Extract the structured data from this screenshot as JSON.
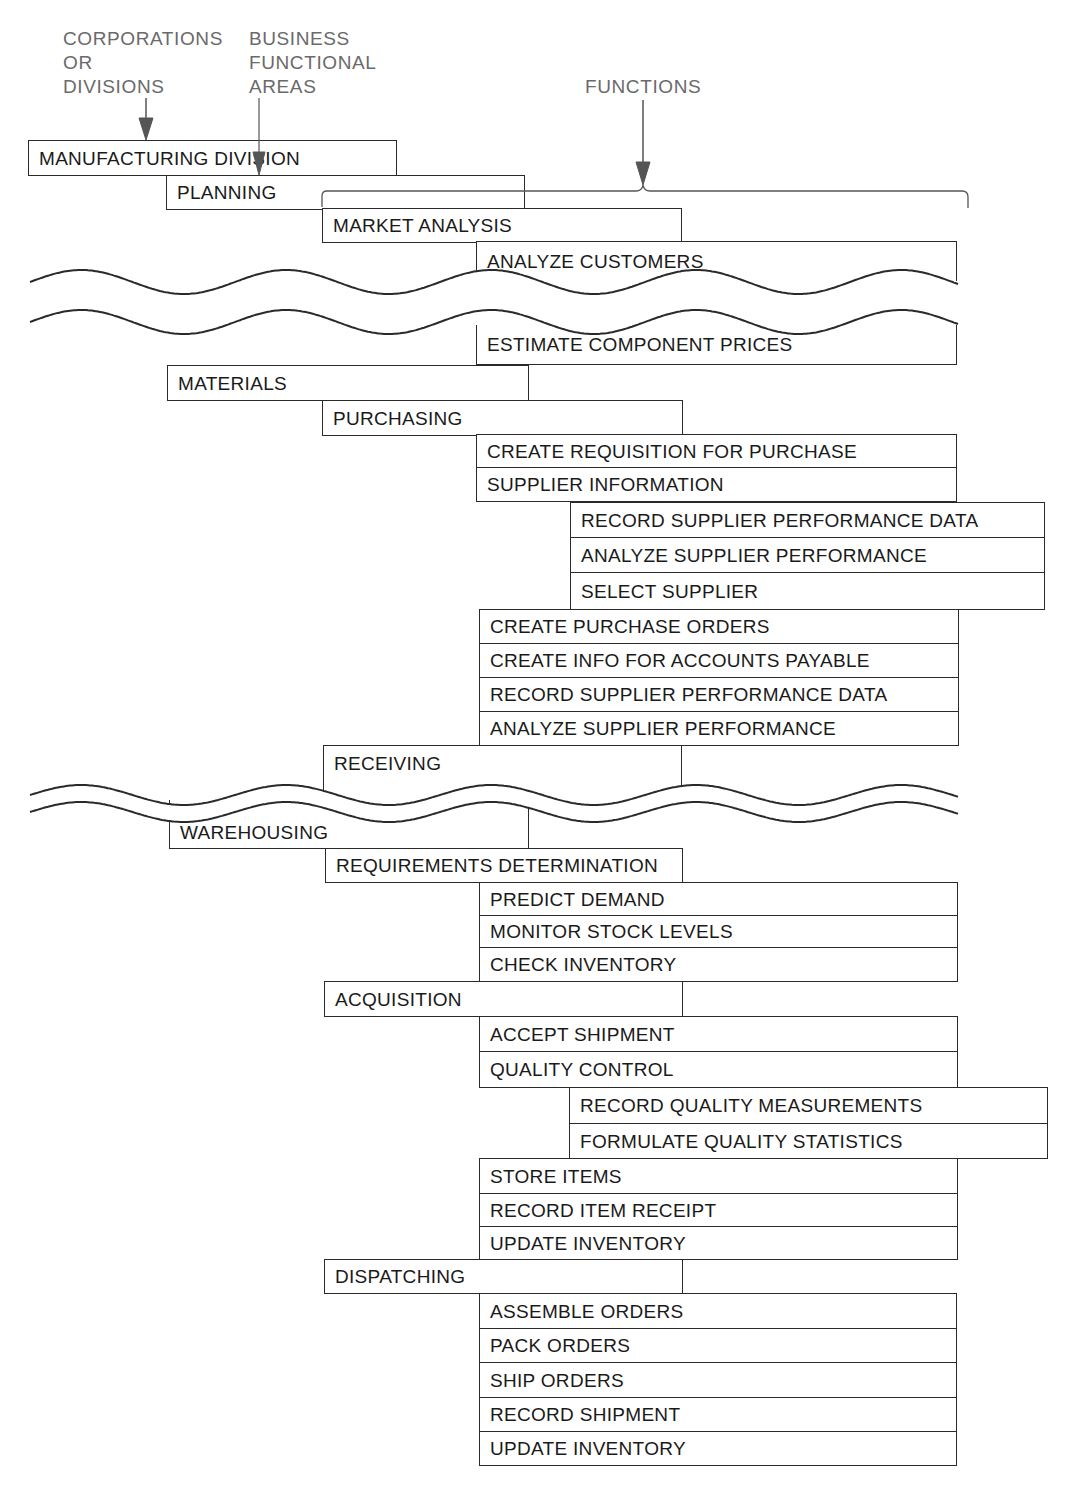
{
  "headers": [
    {
      "id": "corp",
      "lines": "CORPORATIONS\nOR\nDIVISIONS",
      "x": 63,
      "y": 27
    },
    {
      "id": "bfa",
      "lines": "BUSINESS\nFUNCTIONAL\nAREAS",
      "x": 249,
      "y": 27
    },
    {
      "id": "func",
      "lines": "FUNCTIONS",
      "x": 585,
      "y": 75
    }
  ],
  "colors": {
    "line": "#2a2a2a",
    "header_text": "#6a6a6a",
    "arrow": "#555555"
  },
  "boxes": [
    {
      "label": "MANUFACTURING DIVISION",
      "level": "division",
      "x": 28,
      "y": 140,
      "w": 369,
      "h": 36
    },
    {
      "label": "PLANNING",
      "level": "area",
      "x": 166,
      "y": 175,
      "w": 359,
      "h": 35
    },
    {
      "label": "MARKET ANALYSIS",
      "level": "sub-area",
      "x": 322,
      "y": 208,
      "w": 360,
      "h": 35
    },
    {
      "label": "ANALYZE CUSTOMERS",
      "level": "function",
      "x": 476,
      "y": 241,
      "w": 481,
      "h": 40,
      "wavy_bottom": true
    },
    {
      "label": "ESTIMATE COMPONENT PRICES",
      "level": "function",
      "x": 476,
      "y": 325,
      "w": 481,
      "h": 40,
      "wavy_top": true
    },
    {
      "label": "MATERIALS",
      "level": "area",
      "x": 167,
      "y": 365,
      "w": 362,
      "h": 36
    },
    {
      "label": "PURCHASING",
      "level": "sub-area",
      "x": 322,
      "y": 400,
      "w": 361,
      "h": 36
    },
    {
      "label": "CREATE REQUISITION FOR PURCHASE",
      "level": "function",
      "x": 476,
      "y": 434,
      "w": 481,
      "h": 35
    },
    {
      "label": "SUPPLIER INFORMATION",
      "level": "function",
      "x": 476,
      "y": 467,
      "w": 481,
      "h": 35
    },
    {
      "label": "RECORD SUPPLIER PERFORMANCE DATA",
      "level": "sub-function",
      "x": 570,
      "y": 502,
      "w": 475,
      "h": 36
    },
    {
      "label": "ANALYZE SUPPLIER PERFORMANCE",
      "level": "sub-function",
      "x": 570,
      "y": 537,
      "w": 475,
      "h": 36
    },
    {
      "label": "SELECT SUPPLIER",
      "level": "sub-function",
      "x": 570,
      "y": 572,
      "w": 475,
      "h": 38
    },
    {
      "label": "CREATE PURCHASE ORDERS",
      "level": "function",
      "x": 479,
      "y": 609,
      "w": 480,
      "h": 35
    },
    {
      "label": "CREATE INFO FOR ACCOUNTS PAYABLE",
      "level": "function",
      "x": 479,
      "y": 643,
      "w": 480,
      "h": 35
    },
    {
      "label": "RECORD SUPPLIER PERFORMANCE DATA",
      "level": "function",
      "x": 479,
      "y": 677,
      "w": 480,
      "h": 35
    },
    {
      "label": "ANALYZE SUPPLIER PERFORMANCE",
      "level": "function",
      "x": 479,
      "y": 711,
      "w": 480,
      "h": 35
    },
    {
      "label": "RECEIVING",
      "level": "sub-area",
      "x": 323,
      "y": 745,
      "w": 359,
      "h": 58,
      "wavy_bottom": true,
      "align_top": true
    },
    {
      "label": "WAREHOUSING",
      "level": "area",
      "x": 169,
      "y": 800,
      "w": 360,
      "h": 49,
      "wavy_top": true,
      "align_bottom": true
    },
    {
      "label": "REQUIREMENTS DETERMINATION",
      "level": "sub-area",
      "x": 325,
      "y": 848,
      "w": 358,
      "h": 35
    },
    {
      "label": "PREDICT DEMAND",
      "level": "function",
      "x": 479,
      "y": 882,
      "w": 479,
      "h": 34
    },
    {
      "label": "MONITOR STOCK LEVELS",
      "level": "function",
      "x": 479,
      "y": 915,
      "w": 479,
      "h": 33
    },
    {
      "label": "CHECK INVENTORY",
      "level": "function",
      "x": 479,
      "y": 947,
      "w": 479,
      "h": 35
    },
    {
      "label": "ACQUISITION",
      "level": "sub-area",
      "x": 324,
      "y": 981,
      "w": 359,
      "h": 36
    },
    {
      "label": "ACCEPT SHIPMENT",
      "level": "function",
      "x": 479,
      "y": 1016,
      "w": 479,
      "h": 36
    },
    {
      "label": "QUALITY CONTROL",
      "level": "function",
      "x": 479,
      "y": 1051,
      "w": 479,
      "h": 37
    },
    {
      "label": "RECORD QUALITY MEASUREMENTS",
      "level": "sub-function",
      "x": 569,
      "y": 1087,
      "w": 479,
      "h": 37
    },
    {
      "label": "FORMULATE QUALITY STATISTICS",
      "level": "sub-function",
      "x": 569,
      "y": 1123,
      "w": 479,
      "h": 36
    },
    {
      "label": "STORE ITEMS",
      "level": "function",
      "x": 479,
      "y": 1158,
      "w": 479,
      "h": 36
    },
    {
      "label": "RECORD ITEM RECEIPT",
      "level": "function",
      "x": 479,
      "y": 1193,
      "w": 479,
      "h": 34
    },
    {
      "label": "UPDATE INVENTORY",
      "level": "function",
      "x": 479,
      "y": 1226,
      "w": 479,
      "h": 34
    },
    {
      "label": "DISPATCHING",
      "level": "sub-area",
      "x": 324,
      "y": 1259,
      "w": 359,
      "h": 35
    },
    {
      "label": "ASSEMBLE ORDERS",
      "level": "function",
      "x": 479,
      "y": 1293,
      "w": 478,
      "h": 36
    },
    {
      "label": "PACK ORDERS",
      "level": "function",
      "x": 479,
      "y": 1328,
      "w": 478,
      "h": 35
    },
    {
      "label": "SHIP ORDERS",
      "level": "function",
      "x": 479,
      "y": 1362,
      "w": 478,
      "h": 36
    },
    {
      "label": "RECORD SHIPMENT",
      "level": "function",
      "x": 479,
      "y": 1397,
      "w": 478,
      "h": 35
    },
    {
      "label": "UPDATE INVENTORY",
      "level": "function",
      "x": 479,
      "y": 1431,
      "w": 478,
      "h": 35
    }
  ]
}
